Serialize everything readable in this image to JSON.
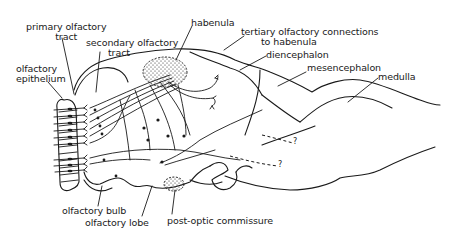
{
  "figure": {
    "type": "neuroanatomy-diagram",
    "colors": {
      "ink": "#1a1a1a",
      "background": "#ffffff"
    }
  },
  "labels": {
    "primary_olfactory_tract": {
      "line1": "primary olfactory",
      "line2": "tract"
    },
    "secondary_olfactory_tract": {
      "line1": "secondary olfactory",
      "line2": "tract"
    },
    "habenula": "habenula",
    "tertiary_connections": {
      "line1": "tertiary olfactory connections",
      "line2": "to habenula"
    },
    "olfactory_epithelium": {
      "line1": "olfactory",
      "line2": "epithelium"
    },
    "diencephalon": "diencephalon",
    "mesencephalon": "mesencephalon",
    "medulla": "medulla",
    "olfactory_bulb": "olfactory bulb",
    "olfactory_lobe": "olfactory lobe",
    "post_optic_commissure": "post-optic commissure",
    "unknown_marker_1": "?",
    "unknown_marker_2": "?"
  }
}
